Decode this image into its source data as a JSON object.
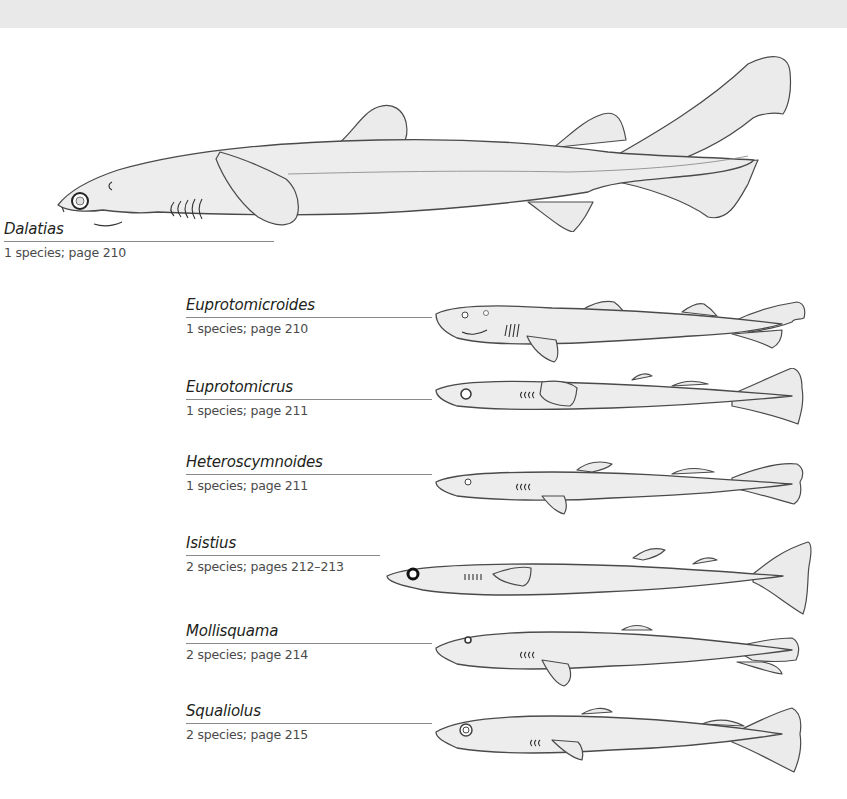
{
  "page": {
    "header_band_color": "#e9e9e9"
  },
  "genera": [
    {
      "name": "Dalatias",
      "info": "1 species; page 210",
      "illustration": "dalatias-shark-illustration"
    },
    {
      "name": "Euprotomicroides",
      "info": "1 species; page 210",
      "illustration": "euprotomicroides-shark-illustration"
    },
    {
      "name": "Euprotomicrus",
      "info": "1 species; page 211",
      "illustration": "euprotomicrus-shark-illustration"
    },
    {
      "name": "Heteroscymnoides",
      "info": "1 species; page 211",
      "illustration": "heteroscymnoides-shark-illustration"
    },
    {
      "name": "Isistius",
      "info": "2 species; pages 212–213",
      "illustration": "isistius-shark-illustration"
    },
    {
      "name": "Mollisquama",
      "info": "2 species; page 214",
      "illustration": "mollisquama-shark-illustration"
    },
    {
      "name": "Squaliolus",
      "info": "2 species; page 215",
      "illustration": "squaliolus-shark-illustration"
    }
  ]
}
